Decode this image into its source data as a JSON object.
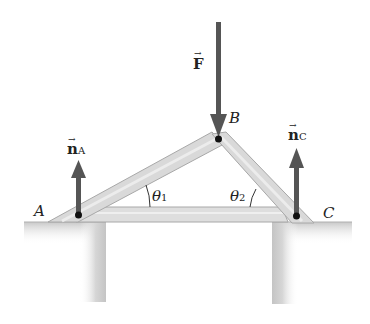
{
  "figure": {
    "points": {
      "A": {
        "label": "A",
        "x": 78,
        "y": 215
      },
      "B": {
        "label": "B",
        "x": 218,
        "y": 139
      },
      "C": {
        "label": "C",
        "x": 296,
        "y": 216
      }
    },
    "forces": {
      "F": {
        "symbol": "F",
        "arrow": "→",
        "direction": "down"
      },
      "nA": {
        "symbol": "n",
        "subscript": "A",
        "arrow": "→",
        "direction": "up"
      },
      "nC": {
        "symbol": "n",
        "subscript": "C",
        "arrow": "→",
        "direction": "up"
      }
    },
    "angles": {
      "theta1": {
        "symbol": "θ",
        "subscript": "1"
      },
      "theta2": {
        "symbol": "θ",
        "subscript": "2"
      }
    },
    "colors": {
      "beam_fill": "#dcdcdc",
      "beam_edge": "#a8a8a8",
      "arrow": "#555555",
      "ground": "#c8c8c8",
      "dot": "#111111"
    }
  }
}
